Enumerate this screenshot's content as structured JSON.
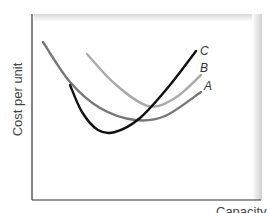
{
  "chart_data": {
    "type": "line",
    "title": "",
    "xlabel": "Capacity",
    "ylabel": "Cost per unit",
    "grid": false,
    "legend": "inline labels at curve ends",
    "series": [
      {
        "name": "A",
        "color": "#777777",
        "points": [
          [
            43,
            42
          ],
          [
            70,
            82
          ],
          [
            100,
            108
          ],
          [
            135,
            120
          ],
          [
            165,
            116
          ],
          [
            201,
            92
          ]
        ]
      },
      {
        "name": "B",
        "color": "#aaaaaa",
        "points": [
          [
            87,
            54
          ],
          [
            115,
            84
          ],
          [
            148,
            106
          ],
          [
            175,
            98
          ],
          [
            201,
            75
          ]
        ]
      },
      {
        "name": "C",
        "color": "#111111",
        "points": [
          [
            70,
            85
          ],
          [
            82,
            112
          ],
          [
            98,
            130
          ],
          [
            115,
            132
          ],
          [
            140,
            118
          ],
          [
            170,
            85
          ],
          [
            196,
            51
          ]
        ]
      }
    ],
    "labels": [
      {
        "text": "C",
        "x": 200,
        "y": 55
      },
      {
        "text": "B",
        "x": 200,
        "y": 72
      },
      {
        "text": "A",
        "x": 204,
        "y": 90
      }
    ]
  }
}
